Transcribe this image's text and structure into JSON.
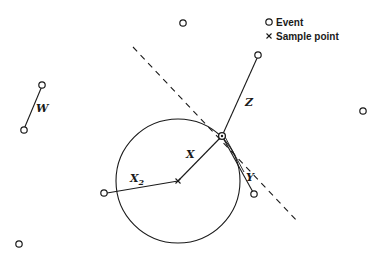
{
  "legend": {
    "event_label": "Event",
    "sample_label": "Sample point"
  },
  "labels": {
    "w": "W",
    "z": "Z",
    "x": "X",
    "x2": "X",
    "x2_sub": "2",
    "y": "Y"
  },
  "colors": {
    "ink": "#1a1a1a",
    "background": "#ffffff"
  }
}
